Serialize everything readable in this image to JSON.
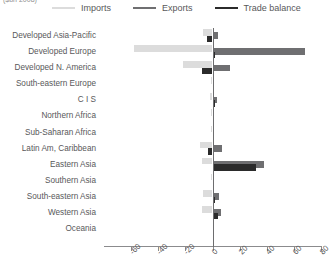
{
  "caption": "($bn 2008)",
  "legend": {
    "position": "top",
    "items": [
      {
        "label": "Imports",
        "color": "#dcdcdc",
        "name": "imports"
      },
      {
        "label": "Exports",
        "color": "#6f6f71",
        "name": "exports"
      },
      {
        "label": "Trade balance",
        "color": "#2b2b2b",
        "name": "trade-balance"
      }
    ]
  },
  "chart_data": {
    "type": "bar",
    "orientation": "horizontal",
    "title": "",
    "subtitle": "",
    "xlabel": "($bn 2008)",
    "ylabel": "",
    "grid": false,
    "legend_position": "top",
    "xlim": [
      -80,
      80
    ],
    "xticks": [
      -60,
      -40,
      -20,
      0,
      20,
      40,
      60,
      80
    ],
    "xtick_labels": [
      "-60",
      "-40",
      "-20",
      "0",
      "20",
      "40",
      "60",
      "80"
    ],
    "categories": [
      "Developed Asia-Pacific",
      "Developed Europe",
      "Developed N. America",
      "South-eastern Europe",
      "C I S",
      "Northern Africa",
      "Sub-Saharan Africa",
      "Latin Am, Caribbean",
      "Eastern Asia",
      "Southern Asia",
      "South-eastern Asia",
      "Western Asia",
      "Oceania"
    ],
    "series": [
      {
        "name": "Imports",
        "color": "#dcdcdc",
        "values": [
          -7,
          -58,
          -22,
          -1,
          -2,
          -1,
          -1,
          -9,
          -8,
          -1,
          -7,
          -8,
          0
        ]
      },
      {
        "name": "Exports",
        "color": "#6f6f71",
        "values": [
          4,
          68,
          13,
          1,
          3,
          1,
          1,
          7,
          38,
          1,
          5,
          6,
          0
        ]
      },
      {
        "name": "Trade balance",
        "color": "#2b2b2b",
        "values": [
          -4,
          2,
          -8,
          0,
          2,
          0,
          0,
          -3,
          32,
          0,
          2,
          4,
          0
        ]
      }
    ]
  }
}
